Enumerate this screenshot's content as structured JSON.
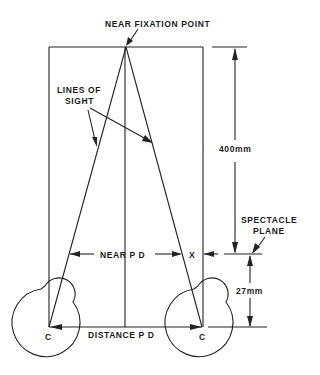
{
  "diagram": {
    "labels": {
      "near_fixation_point": "NEAR FIXATION POINT",
      "lines_of_sight_1": "LINES OF",
      "lines_of_sight_2": "SIGHT",
      "distance_400": "400mm",
      "spectacle_plane_1": "SPECTACLE",
      "spectacle_plane_2": "PLANE",
      "near_pd": "NEAR P D",
      "x_marker": "X",
      "distance_27": "27mm",
      "distance_pd": "DISTANCE P D",
      "center_left": "C",
      "center_right": "C"
    },
    "measurements": {
      "fixation_distance_mm": 400,
      "vertex_to_center_mm": 27
    },
    "colors": {
      "line": "#222222",
      "background": "#ffffff"
    }
  }
}
